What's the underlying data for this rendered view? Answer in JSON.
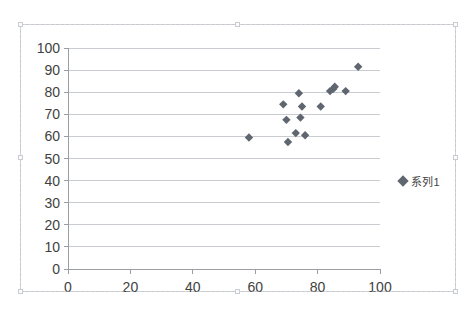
{
  "chart_data": {
    "type": "scatter",
    "title": "",
    "xlabel": "",
    "ylabel": "",
    "xlim": [
      0,
      100
    ],
    "ylim": [
      0,
      100
    ],
    "xticks": [
      0,
      20,
      40,
      60,
      80,
      100
    ],
    "yticks": [
      0,
      10,
      20,
      30,
      40,
      50,
      60,
      70,
      80,
      90,
      100
    ],
    "grid": "horizontal",
    "legend_position": "right",
    "series": [
      {
        "name": "系列1",
        "marker": "diamond",
        "color": "#5f6670",
        "points": [
          [
            58,
            59.5
          ],
          [
            69,
            74.5
          ],
          [
            70,
            67.5
          ],
          [
            70.5,
            57.5
          ],
          [
            73,
            61.5
          ],
          [
            74,
            79.5
          ],
          [
            74.5,
            68.5
          ],
          [
            75,
            73.5
          ],
          [
            76,
            60.5
          ],
          [
            81,
            73.5
          ],
          [
            84,
            80.5
          ],
          [
            85,
            81.5
          ],
          [
            85.5,
            82.5
          ],
          [
            89,
            80.5
          ],
          [
            93,
            91.5
          ]
        ]
      }
    ]
  },
  "legend": {
    "series_label": "系列1",
    "marker_color": "#5f6670"
  },
  "colors": {
    "marker": "#5f6670",
    "gridline": "#c9ccd1",
    "axis": "#9a9da2",
    "tick_text": "#3f3f3f",
    "frame": "#d5d7da"
  },
  "chart_object": {
    "selected": true,
    "handles": [
      "top-left",
      "top-center",
      "top-right",
      "middle-left",
      "middle-right",
      "bottom-left",
      "bottom-center",
      "bottom-right"
    ]
  }
}
